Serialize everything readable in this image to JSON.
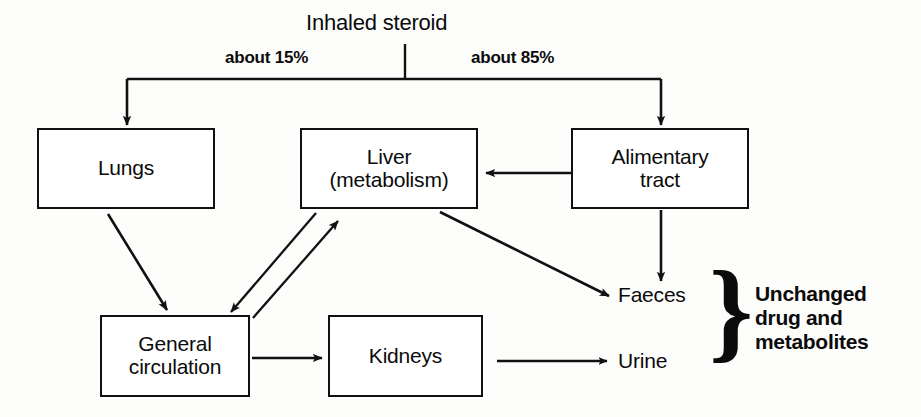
{
  "diagram": {
    "title": "Inhaled steroid",
    "split_labels": {
      "left": "about 15%",
      "right": "about 85%"
    },
    "nodes": [
      {
        "id": "lungs",
        "label": "Lungs"
      },
      {
        "id": "liver",
        "label": "Liver\n(metabolism)"
      },
      {
        "id": "alimentary",
        "label": "Alimentary\ntract"
      },
      {
        "id": "general_circulation",
        "label": "General\ncirculation"
      },
      {
        "id": "kidneys",
        "label": "Kidneys"
      }
    ],
    "outputs": [
      {
        "id": "faeces",
        "label": "Faeces"
      },
      {
        "id": "urine",
        "label": "Urine"
      }
    ],
    "brace_glyph": "}",
    "brace_note": "Unchanged\ndrug and\nmetabolites",
    "edges": [
      {
        "from": "inhaled_steroid",
        "to": "lungs",
        "label": "about 15%"
      },
      {
        "from": "inhaled_steroid",
        "to": "alimentary",
        "label": "about 85%"
      },
      {
        "from": "lungs",
        "to": "general_circulation",
        "label": ""
      },
      {
        "from": "liver",
        "to": "general_circulation",
        "label": ""
      },
      {
        "from": "general_circulation",
        "to": "liver",
        "label": ""
      },
      {
        "from": "alimentary",
        "to": "liver",
        "label": ""
      },
      {
        "from": "alimentary",
        "to": "faeces",
        "label": ""
      },
      {
        "from": "liver",
        "to": "faeces",
        "label": ""
      },
      {
        "from": "general_circulation",
        "to": "kidneys",
        "label": ""
      },
      {
        "from": "kidneys",
        "to": "urine",
        "label": ""
      }
    ],
    "colors": {
      "ink": "#111111",
      "background": "#fdfdfc"
    }
  }
}
